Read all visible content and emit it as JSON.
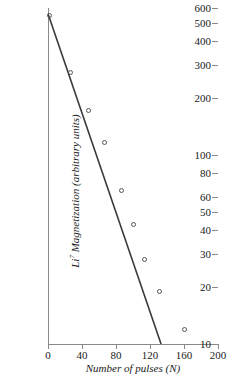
{
  "chart_data": {
    "type": "scatter",
    "title": "",
    "xlabel": "Number of pulses (N)",
    "ylabel_parts": {
      "element": "Li",
      "mass_number": "7",
      "rest": " Magnetization (arbitrary units)"
    },
    "ylabel": "Li7 Magnetization (arbitrary units)",
    "xscale": "linear",
    "yscale": "log",
    "xlim": [
      0,
      200
    ],
    "ylim": [
      10,
      600
    ],
    "grid": false,
    "legend": null,
    "xticks": [
      0,
      40,
      80,
      120,
      160,
      200
    ],
    "xtick_labels": [
      "0",
      "40",
      "80",
      "120",
      "160",
      "200"
    ],
    "yticks": [
      10,
      20,
      30,
      40,
      50,
      60,
      80,
      100,
      200,
      300,
      400,
      500,
      600
    ],
    "ytick_labels": [
      "10",
      "20",
      "30",
      "40",
      "50",
      "60",
      "80",
      "100",
      "200",
      "300",
      "400",
      "500",
      "600"
    ],
    "marker": "open-circle",
    "points": [
      {
        "x": 2,
        "y": 545
      },
      {
        "x": 26,
        "y": 272
      },
      {
        "x": 48,
        "y": 173
      },
      {
        "x": 66,
        "y": 117
      },
      {
        "x": 87,
        "y": 65
      },
      {
        "x": 100,
        "y": 43
      },
      {
        "x": 113,
        "y": 28
      },
      {
        "x": 131,
        "y": 19
      },
      {
        "x": 160,
        "y": 12
      }
    ],
    "fit_line": {
      "label": "",
      "x_start": 0,
      "y_start": 560,
      "x_end": 133,
      "y_end": 10
    }
  },
  "figure": {
    "background_color": "#ffffff",
    "axis_color": "#8a8a8a",
    "marker_color": "#555555",
    "line_color": "#3a3a3a",
    "text_color": "#1a1a1a"
  }
}
